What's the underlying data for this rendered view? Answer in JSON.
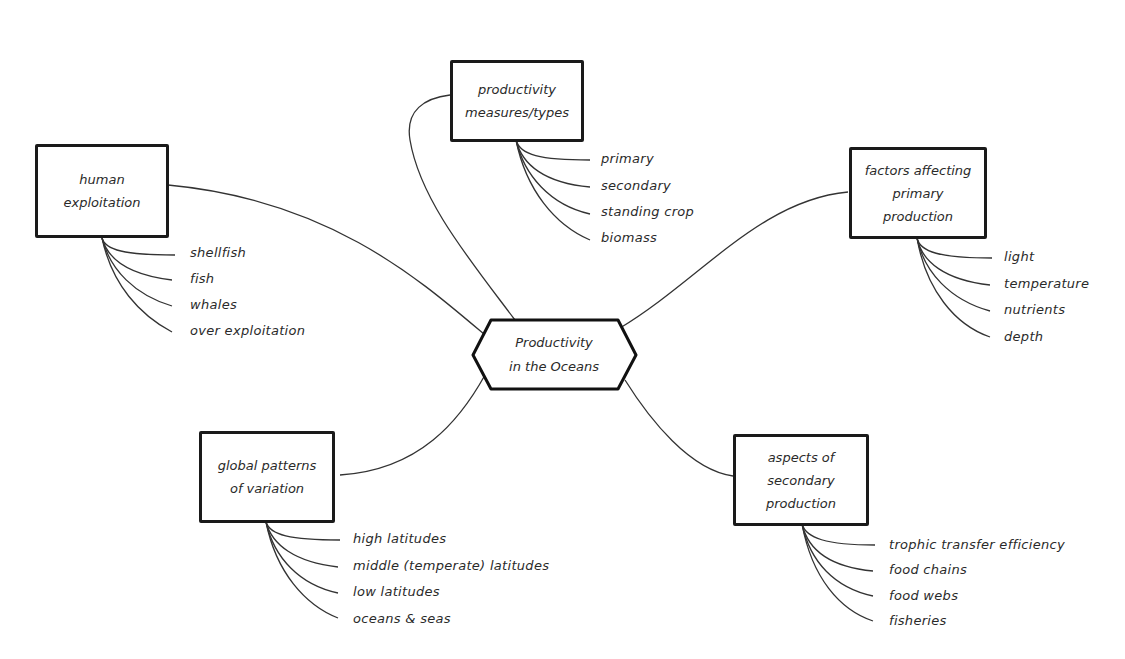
{
  "diagram": {
    "type": "mind-map",
    "central": {
      "lines": [
        "Productivity",
        "in the Oceans"
      ]
    },
    "branches": [
      {
        "id": "productivity-measures",
        "lines": [
          "productivity",
          "measures/types"
        ],
        "items": [
          "primary",
          "secondary",
          "standing crop",
          "biomass"
        ]
      },
      {
        "id": "human-exploitation",
        "lines": [
          "human",
          "exploitation"
        ],
        "items": [
          "shellfish",
          "fish",
          "whales",
          "over exploitation"
        ]
      },
      {
        "id": "factors-primary",
        "lines": [
          "factors affecting",
          "primary",
          "production"
        ],
        "items": [
          "light",
          "temperature",
          "nutrients",
          "depth"
        ]
      },
      {
        "id": "global-patterns",
        "lines": [
          "global patterns",
          "of variation"
        ],
        "items": [
          "high latitudes",
          "middle (temperate) latitudes",
          "low latitudes",
          "oceans & seas"
        ]
      },
      {
        "id": "secondary-production",
        "lines": [
          "aspects of",
          "secondary",
          "production"
        ],
        "items": [
          "trophic transfer efficiency",
          "food chains",
          "food webs",
          "fisheries"
        ]
      }
    ],
    "colors": {
      "line": "#1a1a1a",
      "text": "#2a2a2a",
      "background": "#ffffff"
    }
  }
}
